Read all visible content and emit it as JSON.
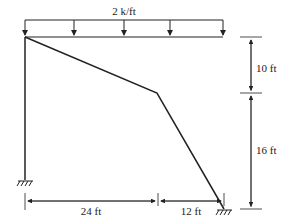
{
  "diagram": {
    "type": "structural-frame",
    "load": {
      "label": "2 k/ft",
      "kind": "uniform-distributed",
      "arrow_count": 5
    },
    "dimensions": {
      "vertical_upper": "10 ft",
      "vertical_lower": "16 ft",
      "horizontal_left": "24 ft",
      "horizontal_right": "12 ft"
    },
    "supports": [
      {
        "name": "left-fixed-support",
        "type": "fixed"
      },
      {
        "name": "right-fixed-support",
        "type": "fixed"
      }
    ],
    "colors": {
      "line": "#222222",
      "background": "#ffffff"
    }
  }
}
